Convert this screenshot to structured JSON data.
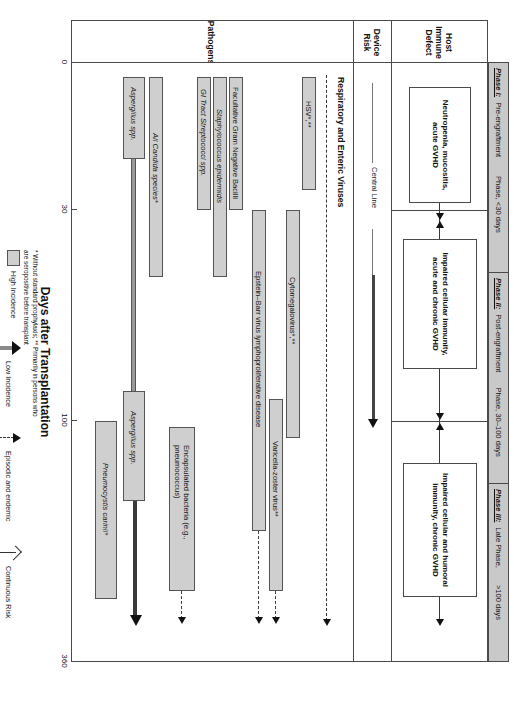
{
  "figure": {
    "axis_title": "Days after Transplantation",
    "x_ticks": [
      "0",
      "30",
      "100",
      "360"
    ],
    "x_tick_values": [
      0,
      30,
      100,
      360
    ]
  },
  "row_labels": [
    {
      "id": "host-immune-defect",
      "label": "Host Immune Defect"
    },
    {
      "id": "device-risk",
      "label": "Device Risk"
    },
    {
      "id": "pathogens",
      "label": "Pathogens"
    }
  ],
  "phases": [
    {
      "name": "Phase I:",
      "desc": "Pre-engraftment",
      "range": "Phase, <30 days"
    },
    {
      "name": "Phase II:",
      "desc": "Post-engraftment",
      "range": "Phase, 30–100 days"
    },
    {
      "name": "Phase III:",
      "desc": "Late Phase,",
      "range": ">100 days"
    }
  ],
  "immune_defects": [
    {
      "id": "defect-phase1",
      "text": "Neutropenia, mucositis, acute GVHD"
    },
    {
      "id": "defect-phase2",
      "text": "Impaired cellular immunity, acute and chronic GVHD"
    },
    {
      "id": "defect-phase3",
      "text": "Impaired cellular and humoral immunity, chronic GVHD"
    }
  ],
  "device_risk": {
    "label": "Central Line"
  },
  "pathogen_groups": [
    {
      "id": "respiratory-enteric-viruses",
      "label": "Respiratory and Enteric Viruses"
    }
  ],
  "pathogens": [
    {
      "id": "hsv",
      "label": "HSV*,**",
      "category": "virus"
    },
    {
      "id": "cytomegalovirus",
      "label": "Cytomegalovirus*,**",
      "category": "virus"
    },
    {
      "id": "varicella-zoster-virus",
      "label": "Varicella-zoster virus**",
      "category": "virus"
    },
    {
      "id": "ebv-lpd",
      "label": "Epstein–Barr virus lymphoproliferative disease",
      "category": "virus"
    },
    {
      "id": "facultative-gram-negative-bacilli",
      "label": "Facultative Gram Negative Bacilli",
      "category": "bacteria"
    },
    {
      "id": "staphylococcus-epidermidis",
      "label": "Staphylococcus epidermidis",
      "category": "bacteria",
      "italic": true
    },
    {
      "id": "gi-tract-streptococci",
      "label": "GI Tract Streptococci spp.",
      "category": "bacteria",
      "italic": true
    },
    {
      "id": "encapsulated-bacteria",
      "label": "Encapsulated bacteria (e.g., pneumococcus)",
      "category": "bacteria"
    },
    {
      "id": "all-candida-species",
      "label": "All Candida species*",
      "category": "fungus",
      "italic": true
    },
    {
      "id": "aspergillus-early",
      "label": "Aspergillus spp.",
      "category": "fungus",
      "italic": true
    },
    {
      "id": "aspergillus-late",
      "label": "Aspergillus spp.",
      "category": "fungus",
      "italic": true
    },
    {
      "id": "pneumocystis-carinii",
      "label": "Pneumocystis carinii*",
      "category": "fungus",
      "italic": true
    }
  ],
  "legend": {
    "items": [
      {
        "id": "high-incidence",
        "label": "High Incidence",
        "glyph": "thick-gray-bar"
      },
      {
        "id": "low-incidence",
        "label": "Low Incidence",
        "glyph": "thin-gray-arrow"
      },
      {
        "id": "episodic-endemic",
        "label": "Episodic and endemic",
        "glyph": "dashed-arrow"
      },
      {
        "id": "continuous-risk",
        "label": "Continuous Risk",
        "glyph": "open-arrow"
      }
    ]
  },
  "footnote": {
    "line1": "* Without standard prophylaxis; ** Primarily in persons who",
    "line2": "are seropositive before transplant"
  },
  "colors": {
    "bar_fill": "#cfcfcf",
    "bar_stroke": "#555555",
    "phase_band": "#c9c9c9",
    "frame": "#4a4a4a"
  }
}
